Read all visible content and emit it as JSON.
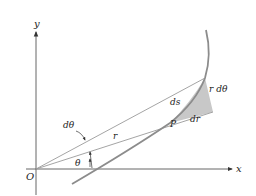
{
  "figure": {
    "labels": {
      "y_axis": "y",
      "x_axis": "x",
      "origin": "O",
      "theta": "θ",
      "dtheta": "dθ",
      "r": "r",
      "point": "P",
      "ds": "ds",
      "dr": "dr",
      "r_dtheta": "r dθ"
    },
    "colors": {
      "line": "#9a9a9a",
      "axis": "#555555",
      "curve": "#8c8c8c",
      "shading": "#c8c8c8",
      "text": "#222222"
    }
  }
}
